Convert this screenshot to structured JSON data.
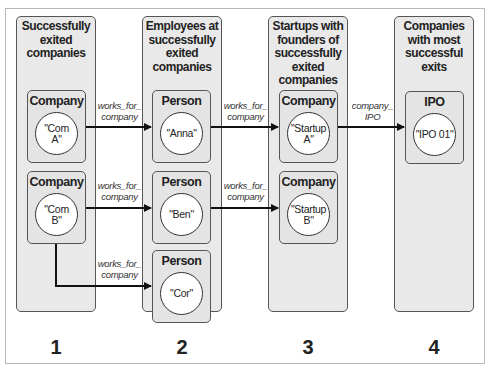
{
  "columns": [
    {
      "number": "1",
      "title": "Successfully exited companies",
      "title_lines": [
        "Successfully",
        "exited",
        "companies"
      ]
    },
    {
      "number": "2",
      "title": "Employees at successfully exited companies",
      "title_lines": [
        "Employees at",
        "successfully",
        "exited",
        "companies"
      ]
    },
    {
      "number": "3",
      "title": "Startups with founders of successfully exited companies",
      "title_lines": [
        "Startups with",
        "founders of",
        "successfully",
        "exited",
        "companies"
      ]
    },
    {
      "number": "4",
      "title": "Companies with most successful exits",
      "title_lines": [
        "Companies",
        "with most",
        "successful",
        "exits"
      ]
    }
  ],
  "nodes": [
    {
      "id": "com_a",
      "label": "Company",
      "value_lines": [
        "\"Com",
        "A\""
      ]
    },
    {
      "id": "com_b",
      "label": "Company",
      "value_lines": [
        "\"Com",
        "B\""
      ]
    },
    {
      "id": "anna",
      "label": "Person",
      "value_lines": [
        "\"Anna\""
      ]
    },
    {
      "id": "ben",
      "label": "Person",
      "value_lines": [
        "\"Ben\""
      ]
    },
    {
      "id": "cor",
      "label": "Person",
      "value_lines": [
        "\"Cor\""
      ]
    },
    {
      "id": "startup_a",
      "label": "Company",
      "value_lines": [
        "\"Startup",
        "A\""
      ]
    },
    {
      "id": "startup_b",
      "label": "Company",
      "value_lines": [
        "\"Startup",
        "B\""
      ]
    },
    {
      "id": "ipo_01",
      "label": "IPO",
      "value_lines": [
        "\"IPO 01\""
      ]
    }
  ],
  "edges": [
    {
      "from": "com_a",
      "to": "anna",
      "label_lines": [
        "works_for_",
        "company"
      ]
    },
    {
      "from": "com_b",
      "to": "ben",
      "label_lines": [
        "works_for_",
        "company"
      ]
    },
    {
      "from": "com_b",
      "to": "cor",
      "label_lines": [
        "works_for_",
        "company"
      ]
    },
    {
      "from": "anna",
      "to": "startup_a",
      "label_lines": [
        "works_for_",
        "company"
      ]
    },
    {
      "from": "ben",
      "to": "startup_b",
      "label_lines": [
        "works_for_",
        "company"
      ]
    },
    {
      "from": "startup_a",
      "to": "ipo_01",
      "label_lines": [
        "company_",
        "IPO"
      ]
    }
  ],
  "colors": {
    "panel": "#e9e9e9",
    "node": "#e4e4e4",
    "stroke": "#555555",
    "arrow": "#111111"
  }
}
